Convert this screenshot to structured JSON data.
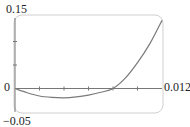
{
  "chart_data": {
    "type": "line",
    "title": "",
    "xlabel": "",
    "ylabel": "",
    "xlim": [
      0,
      0.012
    ],
    "ylim": [
      -0.05,
      0.15
    ],
    "x_tick_interval": 0.002,
    "y_tick_interval": 0.05,
    "tick_labels": {
      "y_top": "0.15",
      "y_bottom": "−0.05",
      "y_zero": "0",
      "x_right": "0.012"
    },
    "grid": false,
    "series": [
      {
        "name": "curve",
        "x": [
          0,
          0.001,
          0.002,
          0.003,
          0.004,
          0.005,
          0.006,
          0.007,
          0.008,
          0.009,
          0.01,
          0.011,
          0.012
        ],
        "y": [
          0,
          -0.009,
          -0.016,
          -0.019,
          -0.02,
          -0.018,
          -0.014,
          -0.008,
          0,
          0.022,
          0.055,
          0.095,
          0.145
        ]
      }
    ],
    "colors": {
      "curve": "#7a7a7a",
      "axis": "#777777",
      "frame": "#cfcfcf"
    }
  }
}
